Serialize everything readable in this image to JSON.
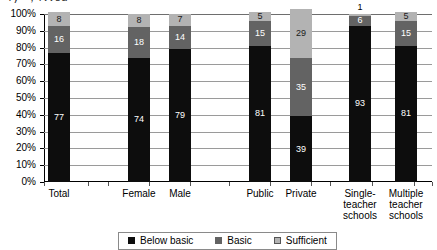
{
  "title_fragment": "ʔγ—, ʕννδα",
  "chart_data": {
    "type": "bar",
    "subtype": "stacked-100-percent",
    "title": "",
    "xlabel": "",
    "ylabel": "",
    "ylim": [
      0,
      100
    ],
    "ytick_labels": [
      "0%",
      "10%",
      "20%",
      "30%",
      "40%",
      "50%",
      "60%",
      "70%",
      "80%",
      "90%",
      "100%"
    ],
    "ytick_values": [
      0,
      10,
      20,
      30,
      40,
      50,
      60,
      70,
      80,
      90,
      100
    ],
    "grid": true,
    "legend_position": "bottom",
    "categories": [
      "Total",
      "Female",
      "Male",
      "Public",
      "Private",
      "Single-teacher schools",
      "Multiple teacher schools"
    ],
    "series": [
      {
        "name": "Below basic",
        "color": "#0d0d0d",
        "values": [
          77,
          74,
          79,
          81,
          39,
          93,
          81
        ]
      },
      {
        "name": "Basic",
        "color": "#636363",
        "values": [
          16,
          18,
          14,
          15,
          35,
          6,
          15
        ]
      },
      {
        "name": "Sufficient",
        "color": "#b3b3b3",
        "values": [
          8,
          8,
          7,
          5,
          29,
          1,
          5
        ]
      }
    ]
  },
  "axis": {
    "y_labels": [
      "100%",
      "90%",
      "80%",
      "70%",
      "60%",
      "50%",
      "40%",
      "30%",
      "20%",
      "10%",
      "0%"
    ]
  },
  "categories": [
    {
      "key": "total",
      "label": "Total",
      "x": 48
    },
    {
      "key": "female",
      "label": "Female",
      "x": 128
    },
    {
      "key": "male",
      "label": "Male",
      "x": 169
    },
    {
      "key": "public",
      "label": "Public",
      "x": 249
    },
    {
      "key": "private",
      "label": "Private",
      "x": 290
    },
    {
      "key": "single-teacher-schools",
      "label": "Single-teacher schools",
      "x": 349
    },
    {
      "key": "multiple-teacher-schools",
      "label": "Multiple teacher schools",
      "x": 395
    }
  ],
  "bars": [
    {
      "key": "total",
      "x": 48,
      "below": 77,
      "basic": 16,
      "sufficient": 8,
      "sufficient_outside": false
    },
    {
      "key": "female",
      "x": 128,
      "below": 74,
      "basic": 18,
      "sufficient": 8,
      "sufficient_outside": false
    },
    {
      "key": "male",
      "x": 169,
      "below": 79,
      "basic": 14,
      "sufficient": 7,
      "sufficient_outside": false
    },
    {
      "key": "public",
      "x": 249,
      "below": 81,
      "basic": 15,
      "sufficient": 5,
      "sufficient_outside": false
    },
    {
      "key": "private",
      "x": 290,
      "below": 39,
      "basic": 35,
      "sufficient": 29,
      "sufficient_outside": false
    },
    {
      "key": "single-teacher-schools",
      "x": 349,
      "below": 93,
      "basic": 6,
      "sufficient": 1,
      "sufficient_outside": true
    },
    {
      "key": "multiple-teacher-schools",
      "x": 395,
      "below": 81,
      "basic": 15,
      "sufficient": 5,
      "sufficient_outside": false
    }
  ],
  "legend": {
    "items": [
      {
        "key": "below-basic",
        "label": "Below basic",
        "swatch": "below"
      },
      {
        "key": "basic",
        "label": "Basic",
        "swatch": "basic"
      },
      {
        "key": "sufficient",
        "label": "Sufficient",
        "swatch": "suff"
      }
    ]
  }
}
